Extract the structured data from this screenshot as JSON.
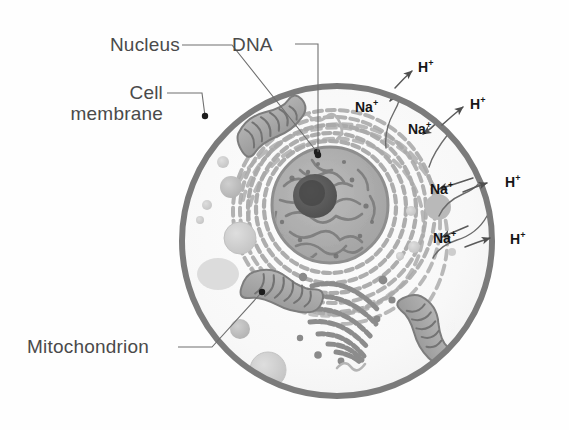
{
  "figure": {
    "background_color": "#fefefe"
  },
  "colors": {
    "membrane": "#7b7b7b",
    "cytoplasm": "#fafafa",
    "nucleus_envelope": "#9a9a9a",
    "nucleoplasm": "#b0b0b0",
    "chromatin": "#808080",
    "nucleolus": "#5d5d5d",
    "er": "#a9a9a9",
    "golgi": "#8a8a8a",
    "mitochondrion": "#9e9e9e",
    "vesicle_light": "#d8d8d8",
    "vesicle_mid": "#c2c2c2",
    "leader_line": "#6f6f6f",
    "label_text": "#4a4a4a",
    "ion_text": "#161616",
    "arrow": "#5a5a5a"
  },
  "callouts": [
    {
      "name": "nucleus",
      "lines": [
        "Nucleus"
      ],
      "x": 83,
      "y": 34,
      "align": "right",
      "leader": {
        "x1": 182,
        "y1": 45,
        "x2": 232,
        "y2": 45,
        "x3": 317,
        "y3": 152
      },
      "dot": {
        "cx": 317,
        "cy": 152,
        "r": 3.2
      }
    },
    {
      "name": "cell-membrane",
      "lines": [
        "Cell",
        "membrane"
      ],
      "x": 25,
      "y": 82,
      "align": "right",
      "leader": {
        "x1": 167,
        "y1": 93,
        "x2": 202,
        "y2": 93,
        "x3": 205,
        "y3": 116
      },
      "dot": {
        "cx": 205,
        "cy": 116,
        "r": 3.2
      }
    },
    {
      "name": "dna",
      "lines": [
        "DNA"
      ],
      "x": 232,
      "y": 34,
      "align": "left",
      "leader": {
        "x1": 295,
        "y1": 44,
        "x2": 318,
        "y2": 44,
        "x3": 318,
        "y3": 155
      },
      "dot": {
        "cx": 318,
        "cy": 155,
        "r": 3.2
      }
    },
    {
      "name": "mitochondrion",
      "lines": [
        "Mitochondrion"
      ],
      "x": 27,
      "y": 336,
      "align": "left",
      "leader": {
        "x1": 178,
        "y1": 347,
        "x2": 212,
        "y2": 347,
        "x3": 262,
        "y3": 292
      },
      "dot": {
        "cx": 262,
        "cy": 292,
        "r": 3.2
      }
    }
  ],
  "ions": [
    {
      "name": "h-plus-1",
      "symbol": "H",
      "charge": "+",
      "x": 418,
      "y": 60
    },
    {
      "name": "na-plus-1",
      "symbol": "Na",
      "charge": "+",
      "x": 355,
      "y": 100
    },
    {
      "name": "h-plus-2",
      "symbol": "H",
      "charge": "+",
      "x": 470,
      "y": 97
    },
    {
      "name": "na-plus-2",
      "symbol": "Na",
      "charge": "+",
      "x": 408,
      "y": 122
    },
    {
      "name": "h-plus-3",
      "symbol": "H",
      "charge": "+",
      "x": 505,
      "y": 175
    },
    {
      "name": "na-plus-3",
      "symbol": "Na",
      "charge": "+",
      "x": 430,
      "y": 182
    },
    {
      "name": "h-plus-4",
      "symbol": "H",
      "charge": "+",
      "x": 510,
      "y": 232
    },
    {
      "name": "na-plus-4",
      "symbol": "Na",
      "charge": "+",
      "x": 433,
      "y": 231
    }
  ],
  "cell": {
    "center_x": 337,
    "center_y": 241,
    "radius": 158,
    "membrane_width": 6
  },
  "nucleus": {
    "center_x": 330,
    "center_y": 205,
    "radius": 58,
    "nucleolus_x": 315,
    "nucleolus_y": 196,
    "nucleolus_r": 22
  },
  "organelles": {
    "mitochondria_count": 3,
    "golgi_cisternae": 7,
    "er_rings": 8,
    "vesicle_count": 14
  }
}
